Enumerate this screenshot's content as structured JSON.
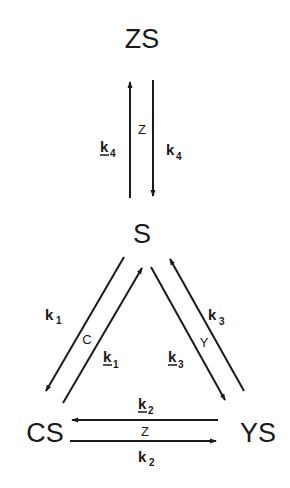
{
  "nodes": {
    "top": "ZS",
    "center": "S",
    "left": "CS",
    "right": "YS"
  },
  "edges": {
    "s_zs": {
      "up_label": {
        "base": "k",
        "sub": "-4",
        "display": "k̲4"
      },
      "down_label": {
        "base": "k",
        "sub": "4"
      },
      "mediator": "Z"
    },
    "s_cs": {
      "forward_label": {
        "base": "k",
        "sub": "1"
      },
      "reverse_label": {
        "base": "k",
        "sub": "-1",
        "display": "k̲1"
      },
      "mediator": "C"
    },
    "s_ys": {
      "forward_label": {
        "base": "k",
        "sub": "3"
      },
      "reverse_label": {
        "base": "k",
        "sub": "-3",
        "display": "k̲3"
      },
      "mediator": "Y"
    },
    "cs_ys": {
      "to_cs_label": {
        "base": "k",
        "sub": "-2",
        "display": "k̲2"
      },
      "to_ys_label": {
        "base": "k",
        "sub": "2"
      },
      "mediator": "Z"
    }
  },
  "colors": {
    "ink": "#1a1a1a",
    "background": "#ffffff"
  }
}
